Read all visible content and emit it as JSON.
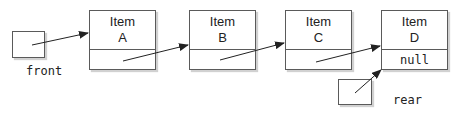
{
  "diagram": {
    "type": "linked-queue",
    "pointers": {
      "front": {
        "label": "front",
        "points_to": "A"
      },
      "rear": {
        "label": "rear",
        "points_to": "D"
      }
    },
    "nodes": [
      {
        "id": "A",
        "line1": "Item",
        "line2": "A",
        "next": ""
      },
      {
        "id": "B",
        "line1": "Item",
        "line2": "B",
        "next": ""
      },
      {
        "id": "C",
        "line1": "Item",
        "line2": "C",
        "next": ""
      },
      {
        "id": "D",
        "line1": "Item",
        "line2": "D",
        "next": "null"
      }
    ],
    "colors": {
      "stroke": "#5a5a5a",
      "arrow": "#222222",
      "background": "#ffffff"
    }
  }
}
